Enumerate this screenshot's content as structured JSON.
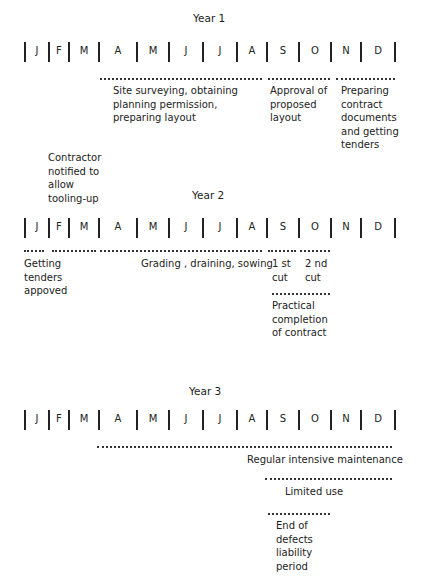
{
  "months": [
    "J",
    "F",
    "M",
    "A",
    "M",
    "J",
    "J",
    "A",
    "S",
    "O",
    "N",
    "D"
  ],
  "year1": {
    "title": "Year 1",
    "activities": [
      {
        "label": "Site surveying, obtaining\nplanning permission,\npreparing layout"
      },
      {
        "label": "Approval of\nproposed\nlayout"
      },
      {
        "label": "Preparing\ncontract\ndocuments\nand getting\ntenders"
      }
    ]
  },
  "between": {
    "contractor_note": "Contractor\nnotified to\nallow\ntooling-up"
  },
  "year2": {
    "title": "Year 2",
    "activities": [
      {
        "label": "Getting\ntenders\nappoved"
      },
      {
        "label": "Grading , draining, sowing"
      },
      {
        "label": "1 st\ncut"
      },
      {
        "label": "2 nd\ncut"
      },
      {
        "label": "Practical\ncompletion\nof contract"
      }
    ]
  },
  "year3": {
    "title": "Year 3",
    "activities": [
      {
        "label": "Regular intensive maintenance"
      },
      {
        "label": "Limited use"
      },
      {
        "label": "End of\ndefects\nliability\nperiod"
      }
    ]
  }
}
